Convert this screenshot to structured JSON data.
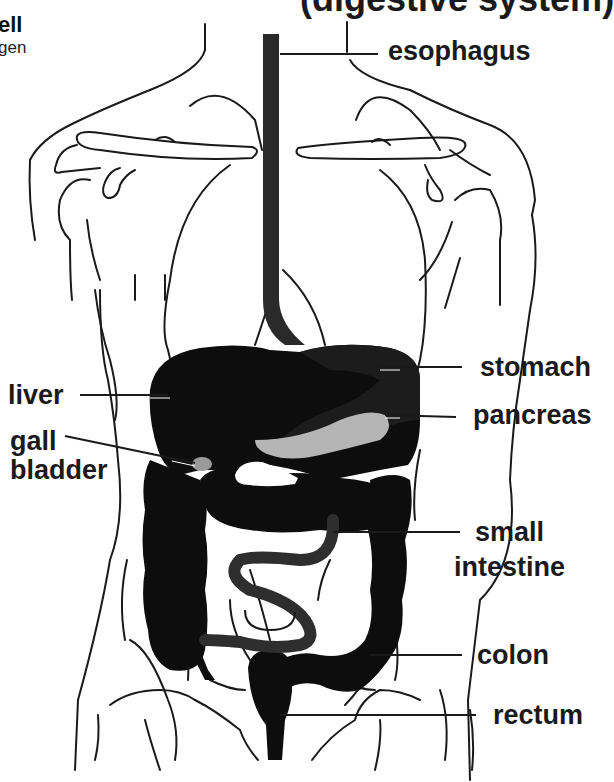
{
  "title": "(digestive system)",
  "corner_text": {
    "line1": "ell",
    "line2": "gen"
  },
  "colors": {
    "organ_fill": "#0d0d0d",
    "pancreas_fill": "#b5b5b5",
    "gallbladder_fill": "#9a9a9a",
    "outline": "#1a1a1a",
    "small_intestine_fill": "#3a3a3a"
  },
  "labels": {
    "esophagus": "esophagus",
    "stomach": "stomach",
    "liver": "liver",
    "pancreas": "pancreas",
    "gall_bladder_1": "gall",
    "gall_bladder_2": "bladder",
    "small_intestine_1": "small",
    "small_intestine_2": "intestine",
    "colon": "colon",
    "rectum": "rectum"
  }
}
